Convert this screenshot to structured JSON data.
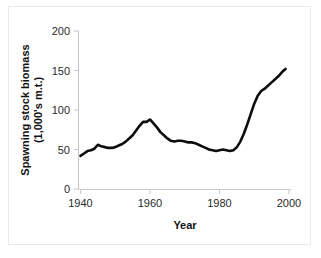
{
  "chart_data": {
    "type": "line",
    "title": "",
    "xlabel": "Year",
    "ylabel": "Spawning stock biomass (1,000's m.t.)",
    "ylabel_line1": "Spawning stock biomass",
    "ylabel_line2": "(1,000's m.t.)",
    "xlim": [
      1940,
      2000
    ],
    "ylim": [
      0,
      200
    ],
    "xticks": [
      1940,
      1960,
      1980,
      2000
    ],
    "xtick_labels": [
      "1940",
      "1960",
      "1980",
      "2000"
    ],
    "yticks": [
      0,
      50,
      100,
      150,
      200
    ],
    "ytick_labels": [
      "0",
      "50",
      "100",
      "150",
      "200"
    ],
    "grid": false,
    "legend": false,
    "line_color": "#0d0d0d",
    "axis_color": "#c8c8c8",
    "x": [
      1940,
      1941,
      1942,
      1943,
      1944,
      1945,
      1946,
      1947,
      1948,
      1949,
      1950,
      1951,
      1952,
      1953,
      1954,
      1955,
      1956,
      1957,
      1958,
      1959,
      1960,
      1961,
      1962,
      1963,
      1964,
      1965,
      1966,
      1967,
      1968,
      1969,
      1970,
      1971,
      1972,
      1973,
      1974,
      1975,
      1976,
      1977,
      1978,
      1979,
      1980,
      1981,
      1982,
      1983,
      1984,
      1985,
      1986,
      1987,
      1988,
      1989,
      1990,
      1991,
      1992,
      1993,
      1994,
      1995,
      1996,
      1997,
      1998,
      1999
    ],
    "values": [
      42,
      45,
      48,
      49,
      51,
      56,
      54,
      53,
      52,
      52,
      53,
      55,
      57,
      60,
      64,
      68,
      74,
      80,
      85,
      85,
      88,
      83,
      78,
      72,
      68,
      64,
      61,
      60,
      61,
      61,
      60,
      59,
      59,
      58,
      56,
      54,
      52,
      50,
      49,
      48,
      49,
      50,
      49,
      48,
      49,
      53,
      60,
      70,
      82,
      95,
      108,
      118,
      124,
      127,
      131,
      135,
      139,
      143,
      148,
      152
    ],
    "series": [
      {
        "name": "Spawning stock biomass",
        "values": [
          42,
          45,
          48,
          49,
          51,
          56,
          54,
          53,
          52,
          52,
          53,
          55,
          57,
          60,
          64,
          68,
          74,
          80,
          85,
          85,
          88,
          83,
          78,
          72,
          68,
          64,
          61,
          60,
          61,
          61,
          60,
          59,
          59,
          58,
          56,
          54,
          52,
          50,
          49,
          48,
          49,
          50,
          49,
          48,
          49,
          53,
          60,
          70,
          82,
          95,
          108,
          118,
          124,
          127,
          131,
          135,
          139,
          143,
          148,
          152
        ]
      }
    ],
    "annotations": {
      "peak_year": 1960,
      "peak_value": 88,
      "start_value": 42,
      "end_value": 152,
      "minimum_value": 48
    }
  }
}
